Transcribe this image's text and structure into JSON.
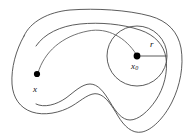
{
  "figure": {
    "type": "diagram",
    "background_color": "#ffffff",
    "stroke_color": "#4a4a4a",
    "dot_color": "#000000",
    "labels": {
      "point_x": "x",
      "point_x0_base": "x",
      "point_x0_sub": "0",
      "radius": "r"
    },
    "elements": {
      "outer_region_name": "open-set-boundary",
      "inner_region_name": "inner-curve-boundary",
      "ball_name": "circle-ball-radius-r",
      "connector_name": "path-from-x-to-x0"
    },
    "geometry": {
      "circle_center": [
        137,
        56
      ],
      "circle_radius": 30,
      "point_x": [
        37,
        74
      ],
      "point_x0": [
        137,
        56
      ],
      "radius_endpoint": [
        167,
        56
      ]
    }
  }
}
